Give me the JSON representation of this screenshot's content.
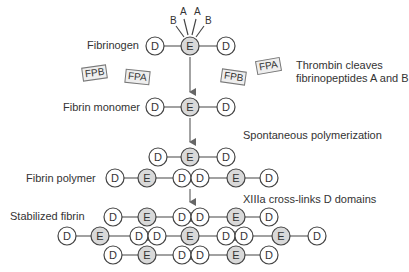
{
  "diagram": {
    "stages": {
      "fibrinogen": "Fibrinogen",
      "monomer": "Fibrin monomer",
      "polymer": "Fibrin polymer",
      "stabilized": "Stabilized fibrin"
    },
    "annotations": {
      "thrombin_line1": "Thrombin cleaves",
      "thrombin_line2": "fibrinopeptides A and B",
      "polymerization": "Spontaneous polymerization",
      "crosslink": "XIIIa cross-links D domains"
    },
    "fibrinopeptides": {
      "fpb1": "FPB",
      "fpa1": "FPA",
      "fpb2": "FPB",
      "fpa2": "FPA"
    },
    "peptide_labels": {
      "b_left": "B",
      "a_left": "A",
      "a_right": "A",
      "b_right": "B"
    },
    "domain_labels": {
      "d": "D",
      "e": "E"
    },
    "colors": {
      "e_fill": "#d9d9d9",
      "d_fill": "#ffffff",
      "stroke": "#444444",
      "arrow": "#666666"
    }
  }
}
